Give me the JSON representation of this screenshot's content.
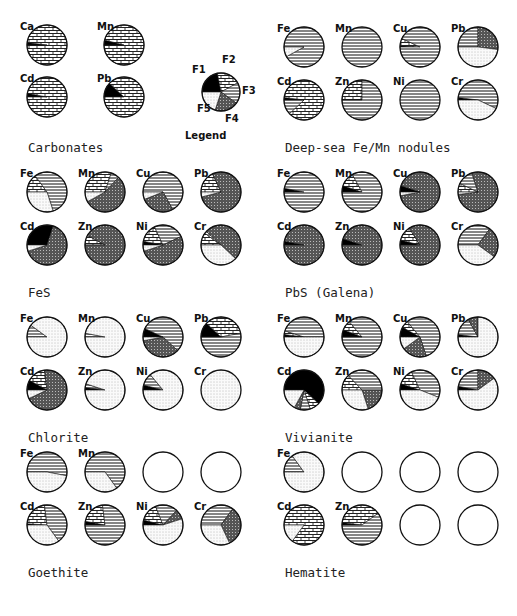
{
  "chart_data": {
    "type": "pie",
    "title": "",
    "legend": {
      "title": "Legend",
      "entries": [
        {
          "key": "F1",
          "pattern": "solid-black"
        },
        {
          "key": "F2",
          "pattern": "brick"
        },
        {
          "key": "F3",
          "pattern": "horizontal-lines"
        },
        {
          "key": "F4",
          "pattern": "dense-grid"
        },
        {
          "key": "F5",
          "pattern": "light-dots"
        }
      ],
      "sample": [
        0.22,
        0.2,
        0.18,
        0.2,
        0.2
      ]
    },
    "fraction_order": [
      "F1",
      "F2",
      "F3",
      "F4",
      "F5"
    ],
    "panels": [
      {
        "title": "Carbonates",
        "pies": [
          {
            "element": "Ca",
            "fractions": [
              0.02,
              0.98,
              0,
              0,
              0
            ]
          },
          {
            "element": "Mn",
            "fractions": [
              0.04,
              0.96,
              0,
              0,
              0
            ]
          },
          {
            "element": "Cd",
            "fractions": [
              0.03,
              0.97,
              0,
              0,
              0
            ]
          },
          {
            "element": "Pb",
            "fractions": [
              0.12,
              0.88,
              0,
              0,
              0
            ]
          }
        ]
      },
      {
        "title": "Deep-sea Fe/Mn nodules",
        "pies": [
          {
            "element": "Fe",
            "fractions": [
              0,
              0,
              0.92,
              0,
              0.08
            ]
          },
          {
            "element": "Mn",
            "fractions": [
              0,
              0,
              1.0,
              0,
              0
            ]
          },
          {
            "element": "Cu",
            "fractions": [
              0.01,
              0.06,
              0.93,
              0,
              0
            ]
          },
          {
            "element": "Pb",
            "fractions": [
              0,
              0,
              0.25,
              0.27,
              0.48
            ]
          },
          {
            "element": "Cd",
            "fractions": [
              0.02,
              0.86,
              0.12,
              0,
              0
            ]
          },
          {
            "element": "Zn",
            "fractions": [
              0,
              0.25,
              0.75,
              0,
              0
            ]
          },
          {
            "element": "Ni",
            "fractions": [
              0,
              0,
              1.0,
              0,
              0
            ]
          },
          {
            "element": "Cr",
            "fractions": [
              0.02,
              0,
              0.55,
              0,
              0.43
            ]
          }
        ]
      },
      {
        "title": "FeS",
        "pies": [
          {
            "element": "Fe",
            "fractions": [
              0,
              0.15,
              0.55,
              0,
              0.3
            ]
          },
          {
            "element": "Mn",
            "fractions": [
              0,
              0.3,
              0.07,
              0.55,
              0.08
            ]
          },
          {
            "element": "Cu",
            "fractions": [
              0,
              0,
              0.67,
              0.27,
              0.06
            ]
          },
          {
            "element": "Pb",
            "fractions": [
              0,
              0.18,
              0,
              0.78,
              0.04
            ]
          },
          {
            "element": "Cd",
            "fractions": [
              0.3,
              0,
              0,
              0.65,
              0.05
            ]
          },
          {
            "element": "Zn",
            "fractions": [
              0,
              0.08,
              0,
              0.92,
              0
            ]
          },
          {
            "element": "Ni",
            "fractions": [
              0.03,
              0.15,
              0.25,
              0.52,
              0.05
            ]
          },
          {
            "element": "Cr",
            "fractions": [
              0,
              0.1,
              0.02,
              0.5,
              0.38
            ]
          }
        ]
      },
      {
        "title": "PbS (Galena)",
        "pies": [
          {
            "element": "Fe",
            "fractions": [
              0.03,
              0,
              0.97,
              0,
              0
            ]
          },
          {
            "element": "Mn",
            "fractions": [
              0.05,
              0.12,
              0.83,
              0,
              0
            ]
          },
          {
            "element": "Cu",
            "fractions": [
              0.05,
              0,
              0,
              0.92,
              0.03
            ]
          },
          {
            "element": "Pb",
            "fractions": [
              0,
              0.07,
              0.13,
              0.78,
              0.02
            ]
          },
          {
            "element": "Cd",
            "fractions": [
              0.03,
              0,
              0,
              0.97,
              0
            ]
          },
          {
            "element": "Zn",
            "fractions": [
              0.05,
              0,
              0,
              0.95,
              0
            ]
          },
          {
            "element": "Ni",
            "fractions": [
              0.04,
              0.12,
              0,
              0.84,
              0
            ]
          },
          {
            "element": "Cr",
            "fractions": [
              0,
              0,
              0.35,
              0.25,
              0.4
            ]
          }
        ]
      },
      {
        "title": "Chlorite",
        "pies": [
          {
            "element": "Fe",
            "fractions": [
              0,
              0,
              0.1,
              0,
              0.9
            ]
          },
          {
            "element": "Mn",
            "fractions": [
              0,
              0,
              0.03,
              0,
              0.97
            ]
          },
          {
            "element": "Cu",
            "fractions": [
              0.07,
              0,
              0.55,
              0.35,
              0.03
            ]
          },
          {
            "element": "Pb",
            "fractions": [
              0.12,
              0.35,
              0.53,
              0,
              0
            ]
          },
          {
            "element": "Cd",
            "fractions": [
              0.08,
              0.15,
              0,
              0.7,
              0.07
            ]
          },
          {
            "element": "Zn",
            "fractions": [
              0.02,
              0,
              0.03,
              0,
              0.95
            ]
          },
          {
            "element": "Ni",
            "fractions": [
              0.04,
              0,
              0.1,
              0,
              0.86
            ]
          },
          {
            "element": "Cr",
            "fractions": [
              0,
              0,
              0,
              0,
              1.0
            ]
          }
        ]
      },
      {
        "title": "Vivianite",
        "pies": [
          {
            "element": "Fe",
            "fractions": [
              0.02,
              0.03,
              0.45,
              0,
              0.5
            ]
          },
          {
            "element": "Mn",
            "fractions": [
              0.06,
              0.08,
              0.86,
              0,
              0
            ]
          },
          {
            "element": "Cu",
            "fractions": [
              0.08,
              0.06,
              0.56,
              0.2,
              0.1
            ]
          },
          {
            "element": "Pb",
            "fractions": [
              0.02,
              0,
              0.15,
              0.08,
              0.75
            ]
          },
          {
            "element": "Cd",
            "fractions": [
              0.62,
              0.08,
              0.08,
              0.05,
              0.17
            ]
          },
          {
            "element": "Zn",
            "fractions": [
              0,
              0.13,
              0.37,
              0.2,
              0.3
            ]
          },
          {
            "element": "Ni",
            "fractions": [
              0.05,
              0.13,
              0.38,
              0,
              0.44
            ]
          },
          {
            "element": "Cr",
            "fractions": [
              0.03,
              0,
              0.22,
              0.15,
              0.6
            ]
          }
        ]
      },
      {
        "title": "Goethite",
        "pies": [
          {
            "element": "Fe",
            "fractions": [
              0,
              0,
              0.53,
              0,
              0.47
            ]
          },
          {
            "element": "Mn",
            "fractions": [
              0,
              0,
              0.65,
              0,
              0.35
            ]
          },
          {
            "element": "Cu",
            "fractions": null
          },
          {
            "element": "Pb",
            "fractions": null
          },
          {
            "element": "Cd",
            "fractions": [
              0.01,
              0.22,
              0.42,
              0,
              0.35
            ]
          },
          {
            "element": "Zn",
            "fractions": [
              0.03,
              0.2,
              0.77,
              0,
              0
            ]
          },
          {
            "element": "Ni",
            "fractions": [
              0.04,
              0.15,
              0.18,
              0.08,
              0.55
            ]
          },
          {
            "element": "Cr",
            "fractions": [
              0,
              0,
              0.35,
              0.33,
              0.32
            ]
          }
        ]
      },
      {
        "title": "Hematite",
        "pies": [
          {
            "element": "Fe",
            "fractions": [
              0,
              0,
              0.15,
              0,
              0.85
            ]
          },
          {
            "element": "Mn",
            "fractions": null
          },
          {
            "element": "Cu",
            "fractions": null
          },
          {
            "element": "Pb",
            "fractions": null
          },
          {
            "element": "Cd",
            "fractions": [
              0,
              0.85,
              0,
              0,
              0.15
            ]
          },
          {
            "element": "Zn",
            "fractions": [
              0.02,
              0.38,
              0.6,
              0,
              0
            ]
          },
          {
            "element": "Ni",
            "fractions": null
          },
          {
            "element": "Cr",
            "fractions": null
          }
        ]
      }
    ]
  },
  "layout": {
    "columns": [
      {
        "panels": [
          0,
          2,
          4,
          6
        ],
        "x0": 18
      },
      {
        "panels": [
          1,
          3,
          5,
          7
        ],
        "x0": 275
      }
    ],
    "block_tops": [
      20,
      165,
      310,
      445
    ],
    "pie_radius": 20,
    "pie_dx": 58,
    "row_dy": 53,
    "title_offset": 132
  }
}
